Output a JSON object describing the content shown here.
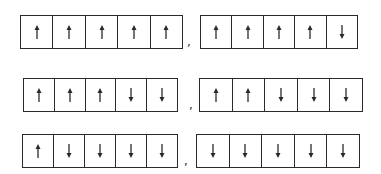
{
  "rows": [
    {
      "left": {
        "spins": [
          "up",
          "up",
          "up",
          "up",
          "up"
        ]
      },
      "separator": ",",
      "right": {
        "spins": [
          "up",
          "up",
          "up",
          "up",
          "down"
        ]
      }
    },
    {
      "left": {
        "spins": [
          "up",
          "up",
          "up",
          "down",
          "down"
        ]
      },
      "separator": ",",
      "right": {
        "spins": [
          "up",
          "up",
          "down",
          "down",
          "down"
        ]
      }
    },
    {
      "left": {
        "spins": [
          "up",
          "down",
          "down",
          "down",
          "down"
        ]
      },
      "separator": ",",
      "right": {
        "spins": [
          "down",
          "down",
          "down",
          "down",
          "down"
        ]
      }
    }
  ],
  "colors": {
    "line": "#2a2a2a",
    "background": "#ffffff"
  }
}
